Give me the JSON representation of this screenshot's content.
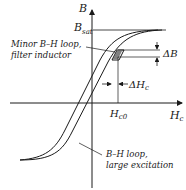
{
  "diagram": {
    "title": "",
    "axes": {
      "y_label": "B",
      "x_label_main": "H",
      "x_label_sub": "c"
    },
    "saturation": {
      "label_main": "B",
      "label_sub": "sat"
    },
    "minor_loop": {
      "label_line1": "Minor B–H loop,",
      "label_line2": "filter inductor"
    },
    "large_loop": {
      "label_line1": "B–H loop,",
      "label_line2": "large excitation"
    },
    "delta_b": {
      "label_main": "ΔB"
    },
    "delta_h": {
      "label_main": "ΔH",
      "label_sub": "c"
    },
    "hc0": {
      "label_main": "H",
      "label_sub": "c0"
    },
    "colors": {
      "ink": "#1a1a1a",
      "background": "#ffffff"
    }
  }
}
